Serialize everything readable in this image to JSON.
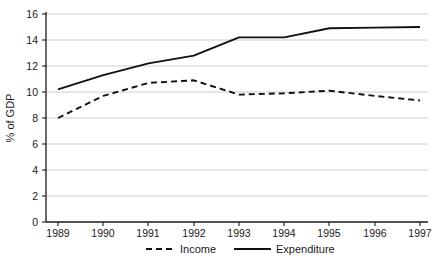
{
  "chart_data": {
    "type": "line",
    "title": "",
    "subtitle": "",
    "xlabel": "",
    "ylabel": "% of GDP",
    "categories": [
      "1989",
      "1990",
      "1991",
      "1992",
      "1993",
      "1994",
      "1995",
      "1996",
      "1997"
    ],
    "x": [
      1989,
      1990,
      1991,
      1992,
      1993,
      1994,
      1995,
      1996,
      1997
    ],
    "series": [
      {
        "name": "Income",
        "style": "dashed",
        "color": "#111111",
        "values": [
          8.0,
          9.7,
          10.7,
          10.9,
          9.8,
          9.9,
          10.1,
          9.7,
          9.35
        ]
      },
      {
        "name": "Expenditure",
        "style": "solid",
        "color": "#111111",
        "values": [
          10.2,
          11.3,
          12.2,
          12.8,
          14.2,
          14.2,
          14.9,
          14.95,
          15.0
        ]
      }
    ],
    "ylim": [
      0,
      16
    ],
    "yticks": [
      0,
      2,
      4,
      6,
      8,
      10,
      12,
      14,
      16
    ],
    "ytick_labels": [
      "0",
      "2",
      "4",
      "6",
      "8",
      "10",
      "12",
      "14",
      "16"
    ],
    "xtick_labels": [
      "1989",
      "1990",
      "1991",
      "1992",
      "1993",
      "1994",
      "1995",
      "1996",
      "1997"
    ],
    "grid": "horizontal",
    "grid_color": "#bfbfbf",
    "legend_position": "bottom-center",
    "legend": [
      {
        "label": "Income",
        "style": "dashed"
      },
      {
        "label": "Expenditure",
        "style": "solid"
      }
    ],
    "annotations": []
  }
}
